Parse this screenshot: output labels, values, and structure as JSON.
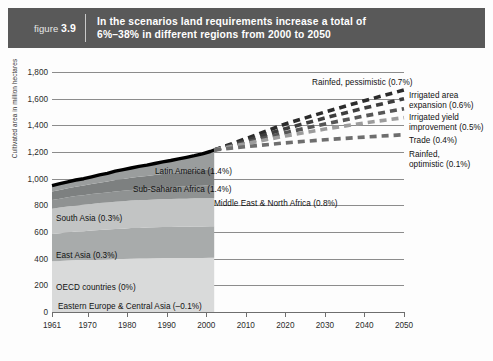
{
  "header": {
    "figure_prefix": "figure",
    "figure_number": "3.9",
    "title_line1": "In the scenarios land requirements increase a total of",
    "title_line2": "6%–38% in different regions from 2000 to 2050",
    "bar_color": "#595959"
  },
  "chart_data": {
    "type": "area",
    "title": "In the scenarios land requirements increase a total of 6%–38% in different regions from 2000 to 2050",
    "xlabel": "",
    "ylabel": "Cultivated area in million hectares",
    "xlim": [
      1961,
      2050
    ],
    "ylim": [
      0,
      1800
    ],
    "ytick_labels": [
      "0",
      "200",
      "400",
      "600",
      "800",
      "1,000",
      "1,200",
      "1,400",
      "1,600",
      "1,800"
    ],
    "ytick_values": [
      0,
      200,
      400,
      600,
      800,
      1000,
      1200,
      1400,
      1600,
      1800
    ],
    "xtick_labels": [
      "1961",
      "1970",
      "1980",
      "1990",
      "2000",
      "2010",
      "2020",
      "2030",
      "2040",
      "2050"
    ],
    "xtick_values": [
      1961,
      1970,
      1980,
      1990,
      2000,
      2010,
      2020,
      2030,
      2040,
      2050
    ],
    "grid": "horizontal",
    "legend_position": "in-plot labels",
    "historical_years": [
      1961,
      1963,
      1965,
      1967,
      1969,
      1971,
      1973,
      1975,
      1977,
      1979,
      1981,
      1983,
      1985,
      1987,
      1989,
      1991,
      1993,
      1995,
      1997,
      1999,
      2001,
      2002
    ],
    "total_line": {
      "name": "Total cultivated area (historical)",
      "color": "#000000",
      "values": [
        948,
        962,
        976,
        990,
        1000,
        1014,
        1028,
        1040,
        1056,
        1068,
        1080,
        1092,
        1102,
        1114,
        1126,
        1136,
        1148,
        1160,
        1172,
        1186,
        1204,
        1215
      ]
    },
    "stacked_series": [
      {
        "name": "OECD countries",
        "growth_label": "(0%)",
        "color": "#d9dada",
        "values": [
          380,
          383,
          386,
          389,
          390,
          392,
          394,
          395,
          397,
          398,
          400,
          401,
          402,
          403,
          404,
          404,
          405,
          405,
          406,
          406,
          407,
          407
        ]
      },
      {
        "name": "East Asia",
        "growth_label": "(0.3%)",
        "color": "#a8abab",
        "values": [
          205,
          208,
          211,
          214,
          216,
          219,
          221,
          223,
          225,
          227,
          229,
          230,
          231,
          232,
          233,
          233,
          234,
          234,
          235,
          235,
          236,
          236
        ]
      },
      {
        "name": "South Asia",
        "growth_label": "(0.3%)",
        "color": "#c2c4c4",
        "values": [
          190,
          192,
          194,
          196,
          198,
          200,
          202,
          203,
          205,
          206,
          207,
          208,
          208,
          209,
          210,
          210,
          211,
          211,
          212,
          212,
          213,
          213
        ]
      },
      {
        "name": "Middle East & North Africa",
        "growth_label": "(0.8%)",
        "color": "#8f9292",
        "values": [
          66,
          67,
          69,
          70,
          71,
          73,
          74,
          76,
          77,
          79,
          80,
          82,
          83,
          85,
          86,
          88,
          89,
          91,
          92,
          94,
          96,
          97
        ]
      },
      {
        "name": "Sub-Saharan Africa",
        "growth_label": "(1.4%)",
        "color": "#7d8080",
        "values": [
          62,
          65,
          68,
          71,
          73,
          76,
          79,
          82,
          85,
          88,
          91,
          94,
          96,
          99,
          102,
          105,
          108,
          111,
          114,
          117,
          121,
          123
        ]
      },
      {
        "name": "Latin America",
        "growth_label": "(1.4%)",
        "color": "#9a9d9d",
        "values": [
          45,
          47,
          48,
          50,
          52,
          54,
          56,
          61,
          67,
          70,
          73,
          77,
          82,
          86,
          91,
          96,
          101,
          108,
          113,
          122,
          131,
          139
        ]
      },
      {
        "name": "Eastern Europe & Central Asia",
        "growth_label": "(–0.1%)",
        "color": "#e8e9e9",
        "values": [
          0,
          0,
          0,
          0,
          0,
          0,
          0,
          0,
          0,
          0,
          0,
          0,
          0,
          0,
          0,
          0,
          0,
          0,
          0,
          0,
          0,
          0
        ]
      }
    ],
    "scenario_years": [
      2002,
      2010,
      2020,
      2030,
      2040,
      2050
    ],
    "scenarios": [
      {
        "name": "Rainfed, pessimistic",
        "growth_label": "(0.7%)",
        "color": "#2b2b2b",
        "values": [
          1215,
          1300,
          1410,
          1500,
          1585,
          1665
        ]
      },
      {
        "name": "Irrigated area expansion",
        "growth_label": "(0.6%)",
        "color": "#3d3d3d",
        "values": [
          1215,
          1285,
          1375,
          1455,
          1530,
          1600
        ]
      },
      {
        "name": "Irrigated yield improvement",
        "growth_label": "(0.5%)",
        "color": "#565656",
        "values": [
          1215,
          1272,
          1345,
          1410,
          1470,
          1525
        ]
      },
      {
        "name": "Trade",
        "growth_label": "(0.4%)",
        "color": "#9c9c9c",
        "values": [
          1215,
          1262,
          1320,
          1372,
          1418,
          1458
        ]
      },
      {
        "name": "Rainfed, optimistic",
        "growth_label": "(0.1%)",
        "color": "#6e6e6e",
        "values": [
          1215,
          1240,
          1268,
          1292,
          1312,
          1330
        ]
      }
    ]
  },
  "region_labels": [
    {
      "text": "Latin America (1.4%)",
      "x": 155,
      "y": 167
    },
    {
      "text": "Sub-Saharan Africa (1.4%)",
      "x": 133,
      "y": 185
    },
    {
      "text": "Middle East & North Africa (0.8%)",
      "x": 214,
      "y": 199
    },
    {
      "text": "South Asia (0.3%)",
      "x": 56,
      "y": 214
    },
    {
      "text": "East Asia (0.3%)",
      "x": 56,
      "y": 251
    },
    {
      "text": "OECD countries (0%)",
      "x": 56,
      "y": 283
    },
    {
      "text": "Eastern Europe & Central Asia (–0.1%)",
      "x": 58,
      "y": 302
    }
  ],
  "scenario_labels": [
    {
      "lines": [
        "Rainfed, pessimistic (0.7%)"
      ],
      "x": 312,
      "y": 78
    },
    {
      "lines": [
        "Irrigated area",
        "expansion (0.6%)"
      ],
      "x": 409,
      "y": 91
    },
    {
      "lines": [
        "Irrigated yield",
        "improvement (0.5%)"
      ],
      "x": 409,
      "y": 113
    },
    {
      "lines": [
        "Trade (0.4%)"
      ],
      "x": 409,
      "y": 136
    },
    {
      "lines": [
        "Rainfed,",
        "optimistic (0.1%)"
      ],
      "x": 409,
      "y": 150
    }
  ]
}
